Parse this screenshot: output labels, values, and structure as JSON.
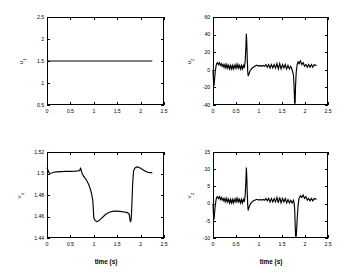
{
  "figure": {
    "background": "#ffffff",
    "line_color": "#000000",
    "axis_color": "#000000"
  },
  "chart_data": [
    {
      "type": "line",
      "panel": "top-left",
      "title": "",
      "xlabel": "",
      "ylabel": "u_1",
      "ylabel_display": "u",
      "ylabel_sub": "1",
      "xlim": [
        0,
        2.5
      ],
      "ylim": [
        0.5,
        2.5
      ],
      "xticks": [
        0,
        0.5,
        1,
        1.5,
        2,
        2.5
      ],
      "xticklabels": [
        "0",
        "0.5",
        "1",
        "1.5",
        "2",
        "2.5"
      ],
      "yticks": [
        0.5,
        1,
        1.5,
        2,
        2.5
      ],
      "yticklabels": [
        "0.5",
        "1",
        "1.5",
        "2",
        "2.5"
      ],
      "grid": false,
      "legend": null,
      "series": [
        {
          "name": "u1",
          "x": [
            0,
            0.05,
            0.2,
            0.4,
            0.6,
            0.8,
            1.0,
            1.2,
            1.4,
            1.6,
            1.8,
            2.0,
            2.1,
            2.25
          ],
          "values": [
            1.5,
            1.5,
            1.5,
            1.5,
            1.5,
            1.5,
            1.5,
            1.5,
            1.5,
            1.5,
            1.5,
            1.5,
            1.5,
            1.5
          ]
        }
      ]
    },
    {
      "type": "line",
      "panel": "top-right",
      "title": "",
      "xlabel": "",
      "ylabel": "u_2",
      "ylabel_display": "u",
      "ylabel_sub": "2",
      "xlim": [
        0,
        2.5
      ],
      "ylim": [
        -40,
        60
      ],
      "xticks": [
        0,
        0.5,
        1,
        1.5,
        2,
        2.5
      ],
      "xticklabels": [
        "0",
        "0.5",
        "1",
        "1.5",
        "2",
        "2.5"
      ],
      "yticks": [
        -40,
        -20,
        0,
        20,
        40,
        60
      ],
      "yticklabels": [
        "-40",
        "-20",
        "0",
        "20",
        "40",
        "60"
      ],
      "grid": false,
      "legend": null,
      "series": [
        {
          "name": "u2",
          "x": [
            0.0,
            0.012,
            0.022,
            0.035,
            0.05,
            0.065,
            0.08,
            0.1,
            0.12,
            0.14,
            0.16,
            0.18,
            0.2,
            0.22,
            0.24,
            0.26,
            0.28,
            0.3,
            0.32,
            0.34,
            0.36,
            0.38,
            0.4,
            0.42,
            0.44,
            0.46,
            0.48,
            0.5,
            0.52,
            0.54,
            0.56,
            0.58,
            0.6,
            0.62,
            0.64,
            0.66,
            0.68,
            0.7,
            0.715,
            0.725,
            0.735,
            0.745,
            0.755,
            0.765,
            0.78,
            0.8,
            0.82,
            0.85,
            0.88,
            0.91,
            0.94,
            0.97,
            1.0,
            1.03,
            1.06,
            1.09,
            1.12,
            1.15,
            1.18,
            1.21,
            1.24,
            1.27,
            1.3,
            1.33,
            1.36,
            1.39,
            1.42,
            1.45,
            1.48,
            1.51,
            1.54,
            1.57,
            1.6,
            1.63,
            1.66,
            1.69,
            1.72,
            1.75,
            1.765,
            1.775,
            1.785,
            1.795,
            1.81,
            1.83,
            1.85,
            1.87,
            1.9,
            1.93,
            1.96,
            1.99,
            2.02,
            2.05,
            2.08,
            2.11,
            2.14,
            2.17,
            2.2,
            2.23,
            2.25
          ],
          "values": [
            0,
            -14,
            -18,
            -10,
            -2,
            4,
            7,
            8,
            6,
            8,
            5,
            7,
            4,
            6,
            3,
            6,
            2,
            6,
            2,
            5,
            1,
            5,
            1,
            5,
            1,
            5,
            2,
            6,
            2,
            6,
            2,
            5,
            1,
            5,
            1,
            5,
            2,
            10,
            26,
            41,
            30,
            12,
            -2,
            -7,
            -5,
            -2,
            0,
            2,
            3,
            4,
            5,
            5,
            4,
            5,
            4,
            5,
            4,
            6,
            3,
            6,
            2,
            6,
            2,
            6,
            2,
            7,
            1,
            7,
            1,
            6,
            2,
            6,
            1,
            5,
            1,
            4,
            0,
            -6,
            -22,
            -38,
            -38,
            -18,
            -2,
            6,
            9,
            7,
            10,
            6,
            8,
            4,
            6,
            3,
            6,
            3,
            6,
            3,
            6,
            5,
            5
          ]
        }
      ]
    },
    {
      "type": "line",
      "panel": "bottom-left",
      "title": "",
      "xlabel": "time (s)",
      "ylabel": "v_1",
      "ylabel_display": "v",
      "ylabel_sub": "1",
      "xlim": [
        0,
        2.5
      ],
      "ylim": [
        1.44,
        1.52
      ],
      "xticks": [
        0,
        0.5,
        1,
        1.5,
        2,
        2.5
      ],
      "xticklabels": [
        "0",
        "0.5",
        "1",
        "1.5",
        "2",
        "2.5"
      ],
      "yticks": [
        1.44,
        1.46,
        1.48,
        1.5,
        1.52
      ],
      "yticklabels": [
        "1.44",
        "1.46",
        "1.48",
        "1.5",
        "1.52"
      ],
      "grid": false,
      "legend": null,
      "series": [
        {
          "name": "v1",
          "x": [
            0.0,
            0.01,
            0.025,
            0.04,
            0.06,
            0.1,
            0.15,
            0.2,
            0.3,
            0.4,
            0.5,
            0.6,
            0.66,
            0.7,
            0.715,
            0.725,
            0.74,
            0.755,
            0.77,
            0.785,
            0.8,
            0.815,
            0.83,
            0.845,
            0.86,
            0.875,
            0.89,
            0.905,
            0.92,
            0.935,
            0.95,
            0.965,
            0.98,
            1.0,
            1.03,
            1.06,
            1.1,
            1.15,
            1.2,
            1.25,
            1.3,
            1.35,
            1.4,
            1.45,
            1.5,
            1.55,
            1.6,
            1.65,
            1.7,
            1.73,
            1.755,
            1.765,
            1.775,
            1.785,
            1.8,
            1.815,
            1.83,
            1.85,
            1.88,
            1.92,
            1.96,
            2.0,
            2.05,
            2.1,
            2.15,
            2.2,
            2.25
          ],
          "values": [
            1.5055,
            1.5045,
            1.5025,
            1.5008,
            1.5002,
            1.5005,
            1.5012,
            1.5015,
            1.5018,
            1.502,
            1.502,
            1.5022,
            1.5025,
            1.5028,
            1.5048,
            1.5042,
            1.5015,
            1.4995,
            1.4985,
            1.4972,
            1.4968,
            1.4955,
            1.4948,
            1.4935,
            1.4925,
            1.4912,
            1.49,
            1.4882,
            1.4862,
            1.4842,
            1.4815,
            1.4782,
            1.4745,
            1.4585,
            1.4562,
            1.4552,
            1.4558,
            1.4578,
            1.4598,
            1.4618,
            1.4632,
            1.4642,
            1.4648,
            1.465,
            1.465,
            1.4648,
            1.4645,
            1.4642,
            1.4638,
            1.4632,
            1.4622,
            1.4595,
            1.4565,
            1.4548,
            1.4582,
            1.4725,
            1.4905,
            1.5025,
            1.5052,
            1.5062,
            1.5058,
            1.5048,
            1.5035,
            1.5022,
            1.5012,
            1.5008,
            1.5008
          ]
        }
      ]
    },
    {
      "type": "line",
      "panel": "bottom-right",
      "title": "",
      "xlabel": "time (s)",
      "ylabel": "v_2",
      "ylabel_display": "v",
      "ylabel_sub": "2",
      "xlim": [
        0,
        2.5
      ],
      "ylim": [
        -10,
        15
      ],
      "xticks": [
        0,
        0.5,
        1,
        1.5,
        2,
        2.5
      ],
      "xticklabels": [
        "0",
        "0.5",
        "1",
        "1.5",
        "2",
        "2.5"
      ],
      "yticks": [
        -10,
        -5,
        0,
        5,
        10,
        15
      ],
      "yticklabels": [
        "-10",
        "-5",
        "0",
        "5",
        "10",
        "15"
      ],
      "grid": false,
      "legend": null,
      "series": [
        {
          "name": "v2",
          "x": [
            0.0,
            0.012,
            0.022,
            0.035,
            0.05,
            0.065,
            0.08,
            0.1,
            0.12,
            0.14,
            0.16,
            0.18,
            0.2,
            0.22,
            0.24,
            0.26,
            0.28,
            0.3,
            0.32,
            0.34,
            0.36,
            0.38,
            0.4,
            0.42,
            0.44,
            0.46,
            0.48,
            0.5,
            0.52,
            0.54,
            0.56,
            0.58,
            0.6,
            0.62,
            0.64,
            0.66,
            0.68,
            0.7,
            0.715,
            0.725,
            0.735,
            0.745,
            0.755,
            0.765,
            0.78,
            0.8,
            0.82,
            0.85,
            0.88,
            0.91,
            0.94,
            0.97,
            1.0,
            1.03,
            1.06,
            1.09,
            1.12,
            1.15,
            1.18,
            1.21,
            1.24,
            1.27,
            1.3,
            1.33,
            1.36,
            1.39,
            1.42,
            1.45,
            1.48,
            1.51,
            1.54,
            1.57,
            1.6,
            1.63,
            1.66,
            1.69,
            1.72,
            1.75,
            1.765,
            1.775,
            1.785,
            1.795,
            1.81,
            1.83,
            1.85,
            1.87,
            1.9,
            1.93,
            1.96,
            1.99,
            2.02,
            2.05,
            2.08,
            2.11,
            2.14,
            2.17,
            2.2,
            2.23,
            2.25
          ],
          "values": [
            0,
            -3.5,
            -4.5,
            -2.5,
            -0.5,
            1.0,
            1.8,
            2.0,
            1.5,
            2.0,
            1.2,
            1.8,
            1.0,
            1.5,
            0.7,
            1.5,
            0.5,
            1.5,
            0.5,
            1.2,
            0.2,
            1.2,
            0.2,
            1.2,
            0.2,
            1.2,
            0.5,
            1.5,
            0.5,
            1.5,
            0.5,
            1.2,
            0.2,
            1.2,
            0.2,
            1.2,
            0.5,
            2.5,
            6.5,
            10.5,
            7.5,
            3.0,
            -0.5,
            -2.0,
            -1.2,
            -0.5,
            0,
            0.5,
            0.8,
            1.0,
            1.2,
            1.2,
            1.0,
            1.2,
            1.0,
            1.2,
            1.0,
            1.5,
            0.8,
            1.5,
            0.5,
            1.5,
            0.5,
            1.5,
            0.5,
            1.8,
            0.2,
            1.8,
            0.2,
            1.5,
            0.5,
            1.5,
            0.2,
            1.2,
            0.2,
            1.0,
            0.2,
            1.0,
            0,
            -1.5,
            -5.5,
            -9.5,
            -9.5,
            -4.5,
            -0.5,
            1.5,
            2.3,
            1.8,
            2.5,
            1.5,
            2.0,
            1.0,
            1.5,
            0.8,
            1.5,
            0.8,
            1.5,
            1.3,
            1.3
          ]
        }
      ]
    }
  ]
}
